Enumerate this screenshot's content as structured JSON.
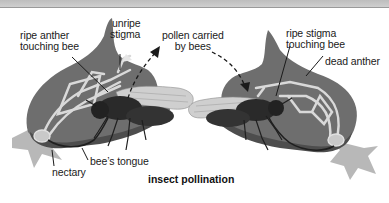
{
  "title": "insect pollination",
  "labels": {
    "ripe_anther": [
      "ripe anther",
      "touching bee"
    ],
    "unripe_stigma": [
      "unripe",
      "stigma"
    ],
    "pollen_carried": [
      "pollen carried",
      "by bees"
    ],
    "ripe_stigma": [
      "ripe stigma",
      "touching bee"
    ],
    "dead_anther": "dead anther",
    "nectary": "nectary",
    "bees_tongue": "bee’s tongue"
  },
  "colors": {
    "petal": "#6e6e6e",
    "petal_dark": "#4d4d4d",
    "structure": "#d9d9d9",
    "sepal": "#b8b8b8",
    "bee": "#2a2a2a",
    "wing": "#cfcfcf",
    "topbar": "#c6c6c6"
  }
}
